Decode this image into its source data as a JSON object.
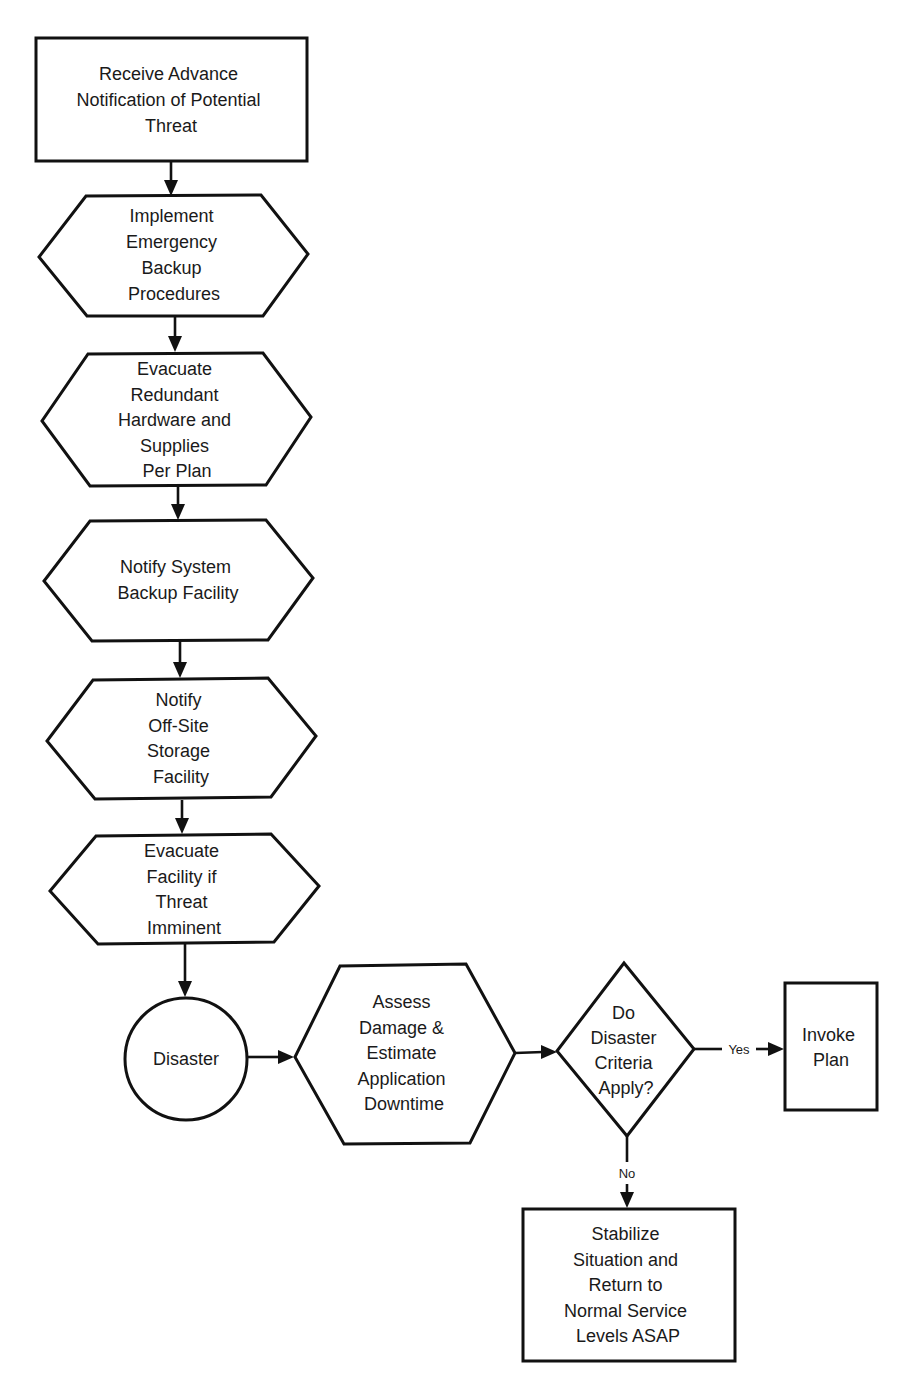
{
  "diagram": {
    "type": "flowchart",
    "nodes": [
      {
        "id": "receive",
        "shape": "rectangle",
        "lines": [
          "Receive Advance",
          "Notification of Potential",
          "Threat"
        ]
      },
      {
        "id": "implement",
        "shape": "hexagon",
        "lines": [
          "Implement",
          "Emergency",
          "Backup",
          "Procedures"
        ]
      },
      {
        "id": "evacuate-hardware",
        "shape": "hexagon",
        "lines": [
          "Evacuate",
          "Redundant",
          "Hardware and",
          "Supplies",
          "Per Plan"
        ]
      },
      {
        "id": "notify-backup",
        "shape": "hexagon",
        "lines": [
          "Notify System",
          "Backup Facility"
        ]
      },
      {
        "id": "notify-offsite",
        "shape": "hexagon",
        "lines": [
          "Notify",
          "Off-Site",
          "Storage",
          "Facility"
        ]
      },
      {
        "id": "evacuate-facility",
        "shape": "hexagon",
        "lines": [
          "Evacuate",
          "Facility if",
          "Threat",
          "Imminent"
        ]
      },
      {
        "id": "disaster",
        "shape": "circle",
        "lines": [
          "Disaster"
        ]
      },
      {
        "id": "assess",
        "shape": "hexagon",
        "lines": [
          "Assess",
          "Damage &",
          "Estimate",
          "Application",
          "Downtime"
        ]
      },
      {
        "id": "criteria",
        "shape": "diamond",
        "lines": [
          "Do",
          "Disaster",
          "Criteria",
          "Apply?"
        ]
      },
      {
        "id": "invoke",
        "shape": "rectangle",
        "lines": [
          "Invoke",
          "Plan"
        ]
      },
      {
        "id": "stabilize",
        "shape": "rectangle",
        "lines": [
          "Stabilize",
          "Situation and",
          "Return to",
          "Normal Service",
          "Levels ASAP"
        ]
      }
    ],
    "edges": [
      {
        "from": "receive",
        "to": "implement",
        "label": ""
      },
      {
        "from": "implement",
        "to": "evacuate-hardware",
        "label": ""
      },
      {
        "from": "evacuate-hardware",
        "to": "notify-backup",
        "label": ""
      },
      {
        "from": "notify-backup",
        "to": "notify-offsite",
        "label": ""
      },
      {
        "from": "notify-offsite",
        "to": "evacuate-facility",
        "label": ""
      },
      {
        "from": "evacuate-facility",
        "to": "disaster",
        "label": ""
      },
      {
        "from": "disaster",
        "to": "assess",
        "label": ""
      },
      {
        "from": "assess",
        "to": "criteria",
        "label": ""
      },
      {
        "from": "criteria",
        "to": "invoke",
        "label": "Yes"
      },
      {
        "from": "criteria",
        "to": "stabilize",
        "label": "No"
      }
    ]
  }
}
